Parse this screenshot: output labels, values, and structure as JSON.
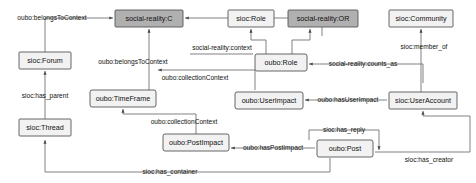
{
  "diagram": {
    "colors": {
      "node_plain_fill": "#f2f2f2",
      "node_shaded_fill": "#b0b0b0",
      "node_stroke": "#555555",
      "edge_stroke": "#6b6b6b",
      "text": "#111111",
      "background": "#ffffff"
    },
    "nodes": [
      {
        "id": "social_reality_c",
        "label": "social-reality:C",
        "style": "shaded",
        "x": 115,
        "y": 10,
        "w": 68,
        "h": 17
      },
      {
        "id": "sioc_role",
        "label": "sioc:Role",
        "style": "plain",
        "x": 228,
        "y": 10,
        "w": 46,
        "h": 17
      },
      {
        "id": "social_reality_or",
        "label": "social-reality:OR",
        "style": "shaded",
        "x": 288,
        "y": 10,
        "w": 70,
        "h": 17
      },
      {
        "id": "sioc_community",
        "label": "sioc:Community",
        "style": "plain",
        "x": 389,
        "y": 10,
        "w": 64,
        "h": 17
      },
      {
        "id": "oubo_role",
        "label": "oubo:Role",
        "style": "plain",
        "x": 255,
        "y": 54,
        "w": 52,
        "h": 17
      },
      {
        "id": "sioc_forum",
        "label": "sioc:Forum",
        "style": "plain",
        "x": 19,
        "y": 52,
        "w": 52,
        "h": 17
      },
      {
        "id": "oubo_timeframe",
        "label": "oubo:TimeFrame",
        "style": "plain",
        "x": 90,
        "y": 90,
        "w": 66,
        "h": 17
      },
      {
        "id": "oubo_userimpact",
        "label": "oubo:UserImpact",
        "style": "plain",
        "x": 235,
        "y": 92,
        "w": 68,
        "h": 17
      },
      {
        "id": "sioc_useraccount",
        "label": "sioc:UserAccount",
        "style": "plain",
        "x": 389,
        "y": 92,
        "w": 68,
        "h": 17
      },
      {
        "id": "sioc_thread",
        "label": "sioc:Thread",
        "style": "plain",
        "x": 19,
        "y": 119,
        "w": 52,
        "h": 17
      },
      {
        "id": "oubo_postimpact",
        "label": "oubo:PostImpact",
        "style": "plain",
        "x": 163,
        "y": 134,
        "w": 66,
        "h": 17
      },
      {
        "id": "oubo_post",
        "label": "oubo:Post",
        "style": "plain",
        "x": 317,
        "y": 140,
        "w": 56,
        "h": 17
      }
    ],
    "edge_labels": [
      {
        "id": "lbl_belongs_to_context_1",
        "text": "oubo:belongsToContext",
        "x": 52,
        "y": 18
      },
      {
        "id": "lbl_belongs_to_context_2",
        "text": "oubo:belongsToContext",
        "x": 133,
        "y": 62
      },
      {
        "id": "lbl_social_reality_context",
        "text": "social-reality:context",
        "x": 222,
        "y": 48
      },
      {
        "id": "lbl_counts_as",
        "text": "social-reality:counts_as",
        "x": 363,
        "y": 64
      },
      {
        "id": "lbl_member_of",
        "text": "sioc:member_of",
        "x": 424,
        "y": 47
      },
      {
        "id": "lbl_collection_context_1",
        "text": "oubo:collectionContext",
        "x": 195,
        "y": 78
      },
      {
        "id": "lbl_collection_context_2",
        "text": "oubo:collectionContext",
        "x": 184,
        "y": 122
      },
      {
        "id": "lbl_has_parent",
        "text": "sioc:has_parent",
        "x": 45,
        "y": 96
      },
      {
        "id": "lbl_has_user_impact",
        "text": "oubo:hasUserImpact",
        "x": 348,
        "y": 100
      },
      {
        "id": "lbl_has_post_impact",
        "text": "oubo:hasPostImpact",
        "x": 273,
        "y": 148
      },
      {
        "id": "lbl_has_reply",
        "text": "sioc:has_reply",
        "x": 344,
        "y": 130
      },
      {
        "id": "lbl_has_creator",
        "text": "sioc:has_creator",
        "x": 429,
        "y": 160
      },
      {
        "id": "lbl_has_container",
        "text": "sioc:has_container",
        "x": 170,
        "y": 172
      }
    ]
  }
}
